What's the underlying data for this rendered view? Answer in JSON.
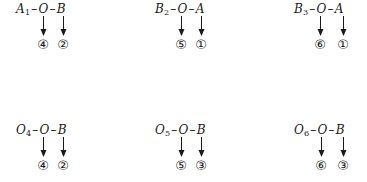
{
  "groups": [
    {
      "base": "A",
      "sub": "1",
      "mid": "O",
      "end": "B",
      "left": "④",
      "right": "②"
    },
    {
      "base": "B",
      "sub": "2",
      "mid": "O",
      "end": "A",
      "left": "⑤",
      "right": "①"
    },
    {
      "base": "B",
      "sub": "3",
      "mid": "O",
      "end": "A",
      "left": "⑥",
      "right": "①"
    },
    {
      "base": "O",
      "sub": "4",
      "mid": "O",
      "end": "B",
      "left": "④",
      "right": "②"
    },
    {
      "base": "O",
      "sub": "5",
      "mid": "O",
      "end": "B",
      "left": "⑤",
      "right": "③"
    },
    {
      "base": "O",
      "sub": "6",
      "mid": "O",
      "end": "B",
      "left": "⑥",
      "right": "③"
    }
  ],
  "dash": "–"
}
